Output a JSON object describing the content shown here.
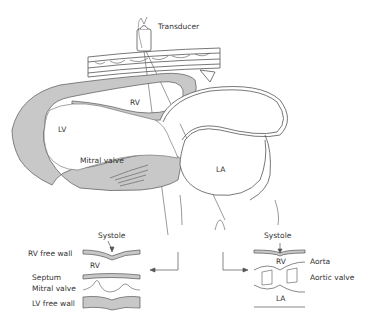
{
  "diagram": {
    "type": "echocardiography-m-mode-schematic",
    "colors": {
      "myocardium_fill": "#c8c8c8",
      "stroke": "#555555",
      "text": "#333333",
      "background": "#ffffff"
    },
    "labels": {
      "transducer": "Transducer",
      "rv": "RV",
      "lv": "LV",
      "mitral_valve": "Mitral valve",
      "la": "LA"
    },
    "left_mmode": {
      "systole": "Systole",
      "rv_free_wall": "RV free wall",
      "rv": "RV",
      "septum": "Septum",
      "mitral_valve": "Mitral valve",
      "lv_free_wall": "LV free wall"
    },
    "right_mmode": {
      "systole": "Systole",
      "rv": "RV",
      "aorta": "Aorta",
      "aortic_valve": "Aortic valve",
      "la": "LA"
    }
  }
}
